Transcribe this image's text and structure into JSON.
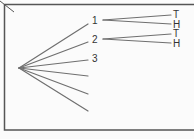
{
  "diagram": {
    "type": "tree",
    "colors": {
      "line": "#6f6f6f",
      "frame": "#555555",
      "text": "#333333",
      "background": "#fbfbfb"
    },
    "root": {
      "x": 19,
      "y": 68
    },
    "first_level": [
      {
        "label": "1",
        "end": [
          88,
          24
        ],
        "label_pos": [
          94,
          24
        ]
      },
      {
        "label": "2",
        "end": [
          88,
          42
        ],
        "label_pos": [
          94,
          43
        ]
      },
      {
        "label": "3",
        "end": [
          88,
          60
        ],
        "label_pos": [
          94,
          62
        ]
      },
      {
        "label": "",
        "end": [
          88,
          76
        ]
      },
      {
        "label": "",
        "end": [
          88,
          94
        ]
      },
      {
        "label": "",
        "end": [
          88,
          111
        ]
      }
    ],
    "second_level": [
      {
        "parent": "1",
        "start": [
          103,
          20
        ],
        "children": [
          {
            "label": "T",
            "end": [
              171,
              15
            ],
            "label_pos": [
              174,
              19
            ]
          },
          {
            "label": "H",
            "end": [
              171,
              24
            ],
            "label_pos": [
              174,
              28
            ]
          }
        ]
      },
      {
        "parent": "2",
        "start": [
          103,
          39
        ],
        "children": [
          {
            "label": "T",
            "end": [
              171,
              34
            ],
            "label_pos": [
              174,
              38
            ]
          },
          {
            "label": "H",
            "end": [
              171,
              43
            ],
            "label_pos": [
              174,
              47
            ]
          }
        ]
      }
    ]
  }
}
